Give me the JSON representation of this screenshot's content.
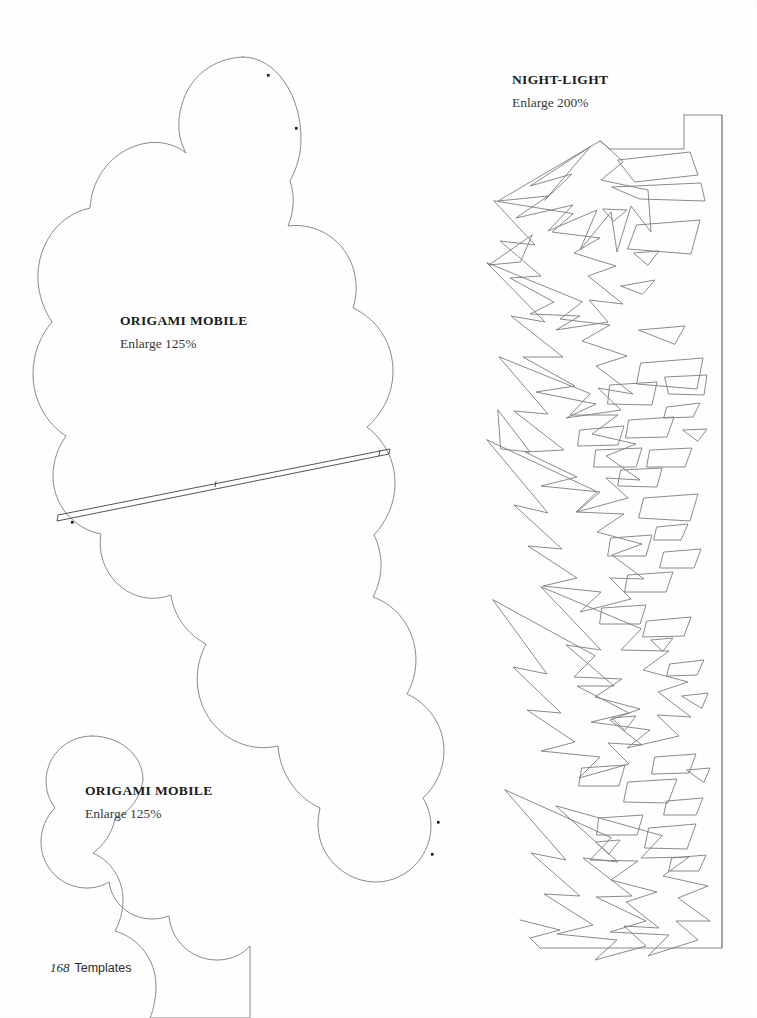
{
  "page": {
    "width": 757,
    "height": 1018,
    "background_color": "#fefefe",
    "line_color": "#7d7d7d",
    "text_color": "#1b1b1b"
  },
  "footer": {
    "page_number": "168",
    "section_label": "Templates"
  },
  "templates": [
    {
      "id": "night-light",
      "title": "NIGHT-LIGHT",
      "scale_note": "Enlarge 200%",
      "description": "Decorative shattered-star cut-out panel with straight right edge and rectangular tab at top right"
    },
    {
      "id": "origami-mobile-large",
      "title": "ORIGAMI MOBILE",
      "scale_note": "Enlarge 125%",
      "description": "Large scalloped cloud shape with diagonal slot and four punch-hole dots"
    },
    {
      "id": "origami-mobile-small",
      "title": "ORIGAMI MOBILE",
      "scale_note": "Enlarge 125%",
      "description": "Small scalloped cloud shape running off the bottom edge of the page"
    }
  ]
}
